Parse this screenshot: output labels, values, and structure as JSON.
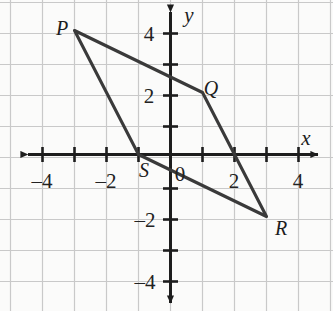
{
  "figure": {
    "name": "coordinate-plane-quadrilateral-pqrs",
    "background_color": "#fbfbfa",
    "grid_color": "#c9c9c9",
    "axis_color": "#1d1d1d",
    "shape_color": "#3a3a3a"
  },
  "axes": {
    "x_label": "x",
    "y_label": "y",
    "origin_label": "0",
    "x_ticks": [
      {
        "value": -4,
        "label": "–4"
      },
      {
        "value": -3,
        "label": ""
      },
      {
        "value": -2,
        "label": "–2"
      },
      {
        "value": -1,
        "label": ""
      },
      {
        "value": 1,
        "label": ""
      },
      {
        "value": 2,
        "label": "2"
      },
      {
        "value": 3,
        "label": ""
      },
      {
        "value": 4,
        "label": "4"
      }
    ],
    "y_ticks": [
      {
        "value": 4,
        "label": "4"
      },
      {
        "value": 3,
        "label": ""
      },
      {
        "value": 2,
        "label": "2"
      },
      {
        "value": 1,
        "label": ""
      },
      {
        "value": -1,
        "label": ""
      },
      {
        "value": -2,
        "label": "–2"
      },
      {
        "value": -3,
        "label": ""
      },
      {
        "value": -4,
        "label": "–4"
      }
    ]
  },
  "chart_data": {
    "type": "scatter",
    "title": "",
    "xlabel": "x",
    "ylabel": "y",
    "xlim": [
      -5,
      5
    ],
    "ylim": [
      -5,
      5
    ],
    "grid": true,
    "legend": "none",
    "shape": "quadrilateral",
    "shape_name": "PQRS",
    "closed": true,
    "vertices": [
      {
        "name": "P",
        "x": -3,
        "y": 4
      },
      {
        "name": "Q",
        "x": 1,
        "y": 2
      },
      {
        "name": "R",
        "x": 3,
        "y": -2
      },
      {
        "name": "S",
        "x": -1,
        "y": 0
      }
    ],
    "edges": [
      {
        "from": "P",
        "to": "Q"
      },
      {
        "from": "Q",
        "to": "R"
      },
      {
        "from": "R",
        "to": "S"
      },
      {
        "from": "S",
        "to": "P"
      }
    ],
    "x_ticks": [
      -4,
      -2,
      2,
      4
    ],
    "y_ticks": [
      4,
      2,
      -2,
      -4
    ]
  },
  "vertex_labels": [
    {
      "name": "P",
      "text": "P",
      "px": 62,
      "py": 28
    },
    {
      "name": "Q",
      "text": "Q",
      "px": 211,
      "py": 88
    },
    {
      "name": "R",
      "text": "R",
      "px": 281,
      "py": 228
    },
    {
      "name": "S",
      "text": "S",
      "px": 144,
      "py": 170
    }
  ]
}
